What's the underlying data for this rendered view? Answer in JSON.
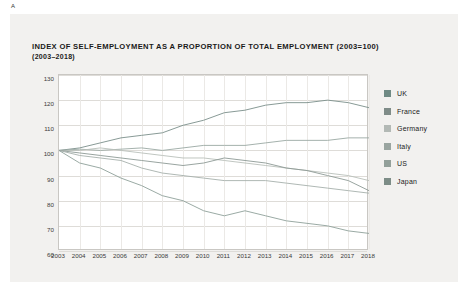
{
  "figure_label": "A",
  "title": "INDEX OF SELF-EMPLOYMENT AS A PROPORTION OF TOTAL EMPLOYMENT (2003=100)",
  "subtitle": "(2003–2018)",
  "chart_data": {
    "type": "line",
    "title": "INDEX OF SELF-EMPLOYMENT AS A PROPORTION OF TOTAL EMPLOYMENT (2003=100)",
    "subtitle": "(2003–2018)",
    "xlabel": "",
    "ylabel": "",
    "ylim": [
      60,
      130
    ],
    "yticks": [
      60,
      70,
      80,
      90,
      100,
      110,
      120,
      130
    ],
    "grid": true,
    "legend_position": "right",
    "x": [
      2003,
      2004,
      2005,
      2006,
      2007,
      2008,
      2009,
      2010,
      2011,
      2012,
      2013,
      2014,
      2015,
      2016,
      2017,
      2018
    ],
    "xticks": [
      "2003",
      "2004",
      "2005",
      "2006",
      "2007",
      "2008",
      "2009",
      "2010",
      "2011",
      "2012",
      "2013",
      "2014",
      "2015",
      "2016",
      "2017",
      "2018"
    ],
    "series": [
      {
        "name": "UK",
        "color": "#7b8f8a",
        "values": [
          100,
          101,
          103,
          105,
          106,
          107,
          110,
          112,
          115,
          116,
          118,
          119,
          119,
          120,
          119,
          117
        ]
      },
      {
        "name": "France",
        "color": "#9aa8a3",
        "values": [
          100,
          100.5,
          100,
          100.5,
          101,
          100,
          101,
          102,
          102,
          102,
          103,
          104,
          104,
          104,
          105,
          105
        ]
      },
      {
        "name": "Germany",
        "color": "#b9bfba",
        "values": [
          100,
          100,
          101,
          100,
          99,
          98,
          97,
          97,
          96,
          95,
          94,
          93,
          92,
          91,
          90,
          88
        ]
      },
      {
        "name": "Italy",
        "color": "#8d9a95",
        "values": [
          100,
          99,
          98,
          97,
          96,
          95,
          94,
          95,
          97,
          96,
          95,
          93,
          92,
          90,
          88,
          84
        ]
      },
      {
        "name": "US",
        "color": "#a6b0ab",
        "values": [
          100,
          98,
          97,
          96,
          93,
          91,
          90,
          89,
          88,
          88,
          88,
          87,
          86,
          85,
          84,
          83
        ]
      },
      {
        "name": "Japan",
        "color": "#8fa09a",
        "values": [
          100,
          95,
          93,
          89,
          86,
          82,
          80,
          76,
          74,
          76,
          74,
          72,
          71,
          70,
          68,
          67
        ]
      }
    ]
  },
  "legend": [
    {
      "label": "UK",
      "color": "#6f8a84"
    },
    {
      "label": "France",
      "color": "#7f8c88"
    },
    {
      "label": "Germany",
      "color": "#b3b9b5"
    },
    {
      "label": "Italy",
      "color": "#9aa5a0"
    },
    {
      "label": "US",
      "color": "#93a09a"
    },
    {
      "label": "Japan",
      "color": "#7d8d87"
    }
  ]
}
